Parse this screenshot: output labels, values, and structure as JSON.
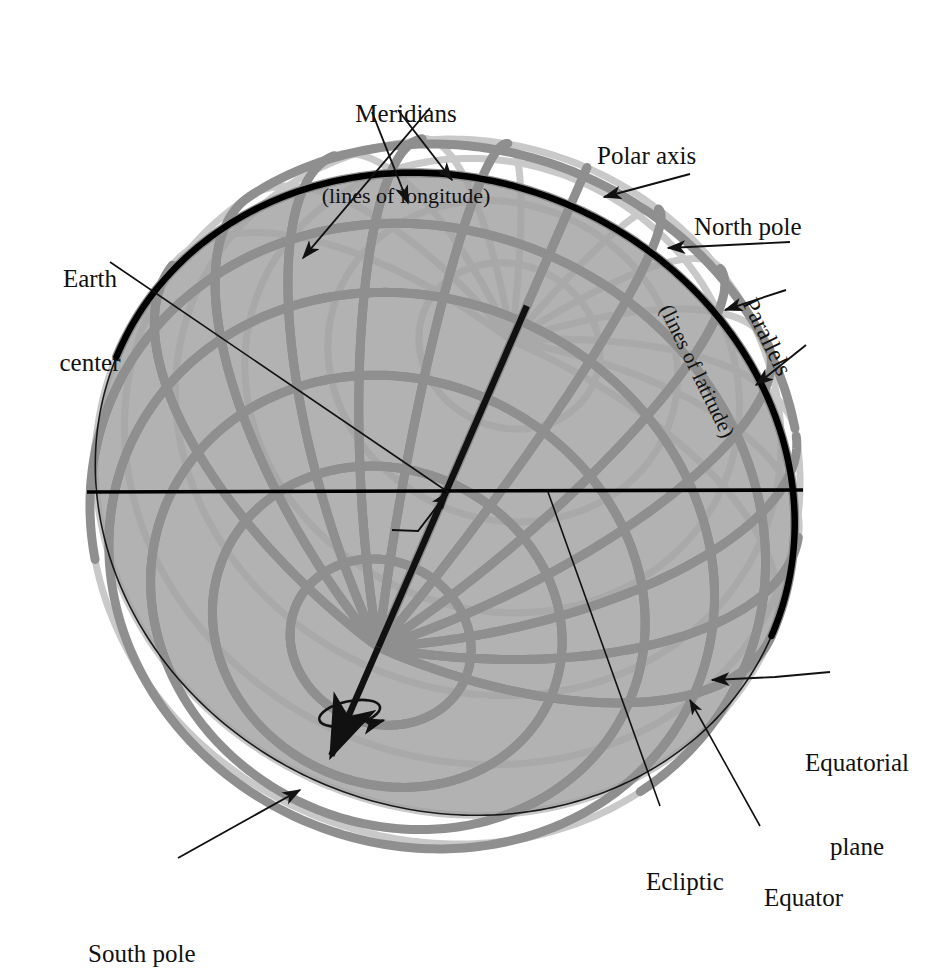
{
  "figure": {
    "kind": "celestial-sphere-diagram"
  },
  "palette": {
    "background": "#ffffff",
    "ink": "#111111",
    "grid_front": "#8f8f8f",
    "grid_back": "#c9c9c9",
    "grid_on_plane": "#8a8a8a",
    "plane_fill": "#b2b2b2",
    "plane_fill_dark": "#a6a6a6",
    "equator_black": "#000000"
  },
  "labels": {
    "meridians": {
      "line1": "Meridians",
      "line2": "(lines of longitude)"
    },
    "polar_axis": {
      "line1": "Polar axis"
    },
    "north_pole": {
      "line1": "North pole"
    },
    "parallels": {
      "line1": "Parallels",
      "line2": "(lines of latitude)"
    },
    "earth_center": {
      "line1": "Earth",
      "line2": "center"
    },
    "equatorial_plane": {
      "line1": "Equatorial",
      "line2": "plane"
    },
    "ecliptic": {
      "line1": "Ecliptic"
    },
    "equator": {
      "line1": "Equator"
    },
    "south_pole": {
      "line1": "South pole"
    }
  },
  "geometry": {
    "sphere_center": [
      445,
      494
    ],
    "sphere_radius": 356,
    "axis_tilt_deg": 23.5,
    "view_tilt_deg": 28,
    "meridian_count": 12,
    "parallel_count": 11,
    "equator_note": "thick black great circle in the equatorial plane",
    "ecliptic_note": "horizontal black line through Earth center"
  }
}
